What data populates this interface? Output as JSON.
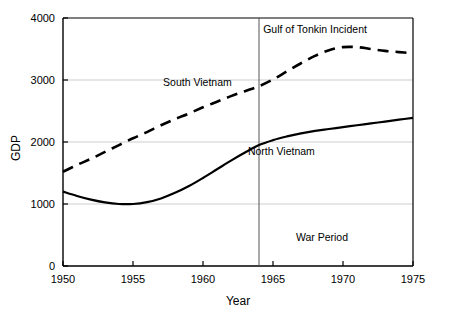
{
  "chart_data": {
    "type": "line",
    "title": "",
    "xlabel": "Year",
    "ylabel": "GDP",
    "xlim": [
      1950,
      1975
    ],
    "ylim": [
      0,
      4000
    ],
    "grid": true,
    "legend_position": "inline-annotations",
    "xticks": [
      "1950",
      "1955",
      "1960",
      "1965",
      "1970",
      "1975"
    ],
    "xtick_values": [
      1950,
      1955,
      1960,
      1965,
      1970,
      1975
    ],
    "yticks": [
      "0",
      "1000",
      "2000",
      "3000",
      "4000"
    ],
    "ytick_values": [
      0,
      1000,
      2000,
      3000,
      4000
    ],
    "x": [
      1950,
      1951,
      1952,
      1953,
      1954,
      1955,
      1956,
      1957,
      1958,
      1959,
      1960,
      1961,
      1962,
      1963,
      1964,
      1965,
      1966,
      1967,
      1968,
      1969,
      1970,
      1971,
      1972,
      1973,
      1974,
      1975
    ],
    "series": [
      {
        "name": "South Vietnam",
        "style": "dashed",
        "color": "#000000",
        "values": [
          1520,
          1630,
          1730,
          1840,
          1950,
          2060,
          2160,
          2270,
          2370,
          2460,
          2560,
          2650,
          2740,
          2820,
          2900,
          3010,
          3140,
          3270,
          3390,
          3480,
          3530,
          3530,
          3500,
          3470,
          3450,
          3430
        ]
      },
      {
        "name": "North Vietnam",
        "style": "solid",
        "color": "#000000",
        "values": [
          1200,
          1130,
          1070,
          1025,
          1000,
          1000,
          1030,
          1090,
          1180,
          1290,
          1420,
          1560,
          1700,
          1830,
          1950,
          2030,
          2090,
          2140,
          2180,
          2210,
          2240,
          2270,
          2300,
          2330,
          2360,
          2390
        ]
      }
    ],
    "series_labels": [
      {
        "text": "South Vietnam",
        "x": 1959.6,
        "y": 2900
      },
      {
        "text": "North Vietnam",
        "x": 1965.6,
        "y": 1790
      }
    ],
    "annotations": [
      {
        "name": "gulf-of-tonkin-marker",
        "text": "Gulf of Tonkin Incident",
        "x": 1964,
        "label_x": 1964.3,
        "label_y": 3760,
        "type": "vline"
      },
      {
        "name": "war-period",
        "text": "War Period",
        "x": 1968.5,
        "y": 410,
        "type": "text"
      }
    ],
    "colors": {
      "axis": "#000000",
      "grid": "#c0c0c0",
      "series": "#000000",
      "background": "#ffffff"
    }
  }
}
